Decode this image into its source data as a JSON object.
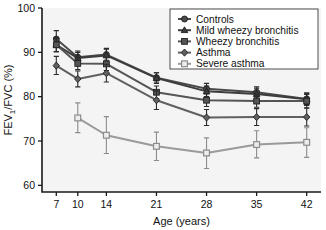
{
  "chart_data": {
    "type": "line",
    "title": "",
    "xlabel": "Age (years)",
    "ylabel": "FEV1/FVC (%)",
    "ylabel_display": "FEV₁/FVC (%)",
    "x": [
      7,
      10,
      14,
      21,
      28,
      35,
      42
    ],
    "xtick_labels": [
      "7",
      "10",
      "14",
      "21",
      "28",
      "35",
      "42"
    ],
    "ytick_labels": [
      "60",
      "70",
      "80",
      "90",
      "100"
    ],
    "yticks": [
      60,
      70,
      80,
      90,
      100
    ],
    "xlim": [
      5,
      44
    ],
    "ylim": [
      58.5,
      100
    ],
    "grid": false,
    "legend_position": "top-right",
    "error_bars": "95% CI",
    "series": [
      {
        "name": "Controls",
        "marker": "circle",
        "color": "#4a4a4a",
        "x": [
          7,
          10,
          14,
          21,
          28,
          35,
          42
        ],
        "values": [
          93.0,
          88.9,
          89.5,
          84.3,
          81.8,
          81.0,
          79.5
        ],
        "err_low": [
          91.3,
          87.6,
          88.2,
          83.3,
          80.8,
          79.9,
          78.2
        ],
        "err_high": [
          94.9,
          90.3,
          90.9,
          85.4,
          83.0,
          82.2,
          80.8
        ]
      },
      {
        "name": "Mild wheezy bronchitis",
        "marker": "triangle",
        "color": "#3d3d3d",
        "x": [
          7,
          10,
          14,
          21,
          28,
          35,
          42
        ],
        "values": [
          91.7,
          88.7,
          89.3,
          84.2,
          81.2,
          80.6,
          79.4
        ],
        "err_low": [
          90.2,
          87.4,
          87.9,
          83.0,
          80.0,
          79.3,
          78.0
        ],
        "err_high": [
          93.2,
          90.0,
          90.7,
          85.4,
          82.4,
          81.9,
          80.8
        ]
      },
      {
        "name": "Wheezy bronchitis",
        "marker": "square",
        "color": "#555555",
        "x": [
          7,
          10,
          14,
          21,
          28,
          35,
          42
        ],
        "values": [
          91.7,
          87.5,
          87.4,
          81.0,
          79.2,
          79.0,
          79.0
        ],
        "err_low": [
          90.1,
          86.1,
          85.9,
          79.6,
          77.8,
          77.6,
          77.5
        ],
        "err_high": [
          93.3,
          88.9,
          88.9,
          82.4,
          80.6,
          80.4,
          80.5
        ]
      },
      {
        "name": "Asthma",
        "marker": "diamond",
        "color": "#606060",
        "x": [
          7,
          10,
          14,
          21,
          28,
          35,
          42
        ],
        "values": [
          87.0,
          84.0,
          85.3,
          79.2,
          75.3,
          75.4,
          75.4
        ],
        "err_low": [
          85.0,
          82.2,
          83.3,
          77.1,
          73.5,
          73.5,
          73.4
        ],
        "err_high": [
          89.1,
          85.8,
          87.3,
          81.3,
          77.1,
          77.3,
          77.4
        ]
      },
      {
        "name": "Severe asthma",
        "marker": "open-square",
        "color": "#9a9a9a",
        "x": [
          10,
          14,
          21,
          28,
          35,
          42
        ],
        "values": [
          75.2,
          71.3,
          68.8,
          67.3,
          69.2,
          69.7
        ],
        "err_low": [
          71.9,
          67.2,
          65.6,
          63.8,
          66.2,
          66.3
        ],
        "err_high": [
          78.6,
          75.5,
          72.0,
          70.7,
          72.3,
          73.0
        ]
      }
    ]
  },
  "legend": {
    "items": [
      {
        "label": "Controls"
      },
      {
        "label": "Mild wheezy bronchitis"
      },
      {
        "label": "Wheezy bronchitis"
      },
      {
        "label": "Asthma"
      },
      {
        "label": "Severe asthma"
      }
    ]
  },
  "colors": {
    "axis": "#1a1a1a",
    "plot_background": "#f4f4f4",
    "figure_background": "#ffffff",
    "legend_border": "#3a3a3a"
  }
}
